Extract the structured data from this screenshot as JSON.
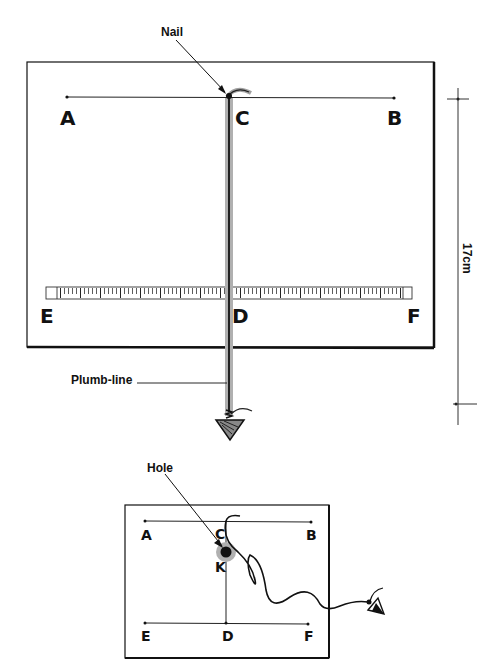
{
  "figure_top": {
    "annotations": {
      "nail": "Nail",
      "plumb_line": "Plumb-line",
      "height_label": "17cm"
    },
    "points": {
      "A": "A",
      "B": "B",
      "C": "C",
      "D": "D",
      "E": "E",
      "F": "F"
    },
    "colors": {
      "line": "#111111",
      "plumb_shadow": "#b0b0b0"
    }
  },
  "figure_bottom": {
    "annotations": {
      "hole": "Hole"
    },
    "points": {
      "A": "A",
      "B": "B",
      "C": "C",
      "D": "D",
      "E": "E",
      "F": "F",
      "K": "K"
    },
    "colors": {
      "hole_glow": "#a8a8a8"
    }
  }
}
